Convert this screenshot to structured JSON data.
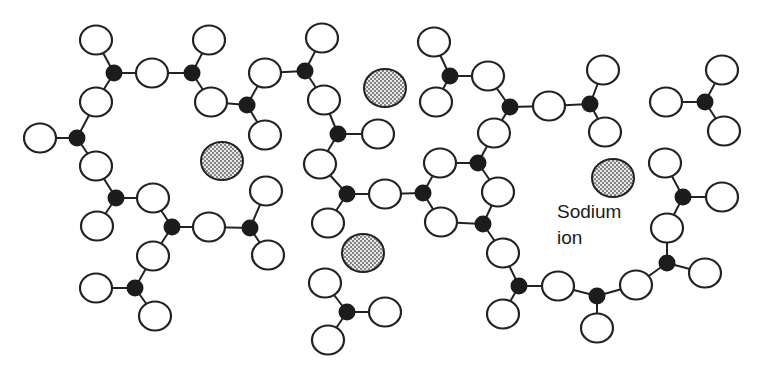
{
  "diagram": {
    "label": {
      "line1": "Sodium",
      "line2": "ion"
    },
    "legend_colors": {
      "oxygen_fill": "#ffffff",
      "silicon_fill": "#1c1c1c",
      "sodium_pattern": "stippled grey"
    },
    "silicon": [
      [
        114,
        73
      ],
      [
        192,
        73
      ],
      [
        247,
        105
      ],
      [
        77,
        138
      ],
      [
        116,
        198
      ],
      [
        172,
        227
      ],
      [
        250,
        228
      ],
      [
        135,
        288
      ],
      [
        305,
        71
      ],
      [
        338,
        134
      ],
      [
        347,
        194
      ],
      [
        423,
        193
      ],
      [
        347,
        312
      ],
      [
        450,
        76
      ],
      [
        510,
        107
      ],
      [
        590,
        104
      ],
      [
        478,
        163
      ],
      [
        483,
        224
      ],
      [
        519,
        286
      ],
      [
        597,
        296
      ],
      [
        705,
        102
      ],
      [
        683,
        197
      ],
      [
        667,
        263
      ]
    ],
    "oxygen": [
      [
        96,
        40
      ],
      [
        96,
        102
      ],
      [
        152,
        73
      ],
      [
        209,
        40
      ],
      [
        211,
        102
      ],
      [
        40,
        138
      ],
      [
        96,
        166
      ],
      [
        97,
        226
      ],
      [
        153,
        198
      ],
      [
        209,
        227
      ],
      [
        266,
        191
      ],
      [
        268,
        255
      ],
      [
        153,
        256
      ],
      [
        96,
        288
      ],
      [
        155,
        316
      ],
      [
        265,
        73
      ],
      [
        265,
        135
      ],
      [
        322,
        38
      ],
      [
        324,
        100
      ],
      [
        378,
        134
      ],
      [
        320,
        164
      ],
      [
        385,
        194
      ],
      [
        328,
        223
      ],
      [
        441,
        222
      ],
      [
        325,
        283
      ],
      [
        385,
        312
      ],
      [
        328,
        340
      ],
      [
        434,
        42
      ],
      [
        436,
        102
      ],
      [
        488,
        76
      ],
      [
        549,
        106
      ],
      [
        603,
        70
      ],
      [
        605,
        132
      ],
      [
        494,
        133
      ],
      [
        440,
        163
      ],
      [
        498,
        192
      ],
      [
        503,
        253
      ],
      [
        558,
        286
      ],
      [
        503,
        314
      ],
      [
        597,
        328
      ],
      [
        636,
        285
      ],
      [
        667,
        228
      ],
      [
        665,
        163
      ],
      [
        722,
        197
      ],
      [
        705,
        273
      ],
      [
        666,
        102
      ],
      [
        722,
        70
      ],
      [
        724,
        131
      ]
    ],
    "bonds": [
      [
        [
          96,
          40
        ],
        [
          114,
          73
        ]
      ],
      [
        [
          114,
          73
        ],
        [
          96,
          102
        ]
      ],
      [
        [
          114,
          73
        ],
        [
          152,
          73
        ]
      ],
      [
        [
          152,
          73
        ],
        [
          192,
          73
        ]
      ],
      [
        [
          192,
          73
        ],
        [
          209,
          40
        ]
      ],
      [
        [
          192,
          73
        ],
        [
          211,
          102
        ]
      ],
      [
        [
          211,
          102
        ],
        [
          247,
          105
        ]
      ],
      [
        [
          247,
          105
        ],
        [
          265,
          73
        ]
      ],
      [
        [
          247,
          105
        ],
        [
          265,
          135
        ]
      ],
      [
        [
          265,
          73
        ],
        [
          305,
          71
        ]
      ],
      [
        [
          305,
          71
        ],
        [
          322,
          38
        ]
      ],
      [
        [
          305,
          71
        ],
        [
          324,
          100
        ]
      ],
      [
        [
          324,
          100
        ],
        [
          338,
          134
        ]
      ],
      [
        [
          338,
          134
        ],
        [
          378,
          134
        ]
      ],
      [
        [
          338,
          134
        ],
        [
          320,
          164
        ]
      ],
      [
        [
          320,
          164
        ],
        [
          347,
          194
        ]
      ],
      [
        [
          347,
          194
        ],
        [
          385,
          194
        ]
      ],
      [
        [
          347,
          194
        ],
        [
          328,
          223
        ]
      ],
      [
        [
          385,
          194
        ],
        [
          423,
          193
        ]
      ],
      [
        [
          423,
          193
        ],
        [
          441,
          222
        ]
      ],
      [
        [
          423,
          193
        ],
        [
          440,
          163
        ]
      ],
      [
        [
          440,
          163
        ],
        [
          478,
          163
        ]
      ],
      [
        [
          478,
          163
        ],
        [
          494,
          133
        ]
      ],
      [
        [
          478,
          163
        ],
        [
          498,
          192
        ]
      ],
      [
        [
          494,
          133
        ],
        [
          510,
          107
        ]
      ],
      [
        [
          510,
          107
        ],
        [
          488,
          76
        ]
      ],
      [
        [
          510,
          107
        ],
        [
          549,
          106
        ]
      ],
      [
        [
          549,
          106
        ],
        [
          590,
          104
        ]
      ],
      [
        [
          590,
          104
        ],
        [
          603,
          70
        ]
      ],
      [
        [
          590,
          104
        ],
        [
          605,
          132
        ]
      ],
      [
        [
          488,
          76
        ],
        [
          450,
          76
        ]
      ],
      [
        [
          450,
          76
        ],
        [
          434,
          42
        ]
      ],
      [
        [
          450,
          76
        ],
        [
          436,
          102
        ]
      ],
      [
        [
          498,
          192
        ],
        [
          483,
          224
        ]
      ],
      [
        [
          441,
          222
        ],
        [
          483,
          224
        ]
      ],
      [
        [
          483,
          224
        ],
        [
          503,
          253
        ]
      ],
      [
        [
          503,
          253
        ],
        [
          519,
          286
        ]
      ],
      [
        [
          519,
          286
        ],
        [
          558,
          286
        ]
      ],
      [
        [
          519,
          286
        ],
        [
          503,
          314
        ]
      ],
      [
        [
          558,
          286
        ],
        [
          597,
          296
        ]
      ],
      [
        [
          597,
          296
        ],
        [
          597,
          328
        ]
      ],
      [
        [
          597,
          296
        ],
        [
          636,
          285
        ]
      ],
      [
        [
          636,
          285
        ],
        [
          667,
          263
        ]
      ],
      [
        [
          667,
          263
        ],
        [
          705,
          273
        ]
      ],
      [
        [
          667,
          263
        ],
        [
          667,
          228
        ]
      ],
      [
        [
          667,
          228
        ],
        [
          683,
          197
        ]
      ],
      [
        [
          683,
          197
        ],
        [
          665,
          163
        ]
      ],
      [
        [
          683,
          197
        ],
        [
          722,
          197
        ]
      ],
      [
        [
          666,
          102
        ],
        [
          705,
          102
        ]
      ],
      [
        [
          705,
          102
        ],
        [
          722,
          70
        ]
      ],
      [
        [
          705,
          102
        ],
        [
          724,
          131
        ]
      ],
      [
        [
          40,
          138
        ],
        [
          77,
          138
        ]
      ],
      [
        [
          77,
          138
        ],
        [
          96,
          102
        ]
      ],
      [
        [
          77,
          138
        ],
        [
          96,
          166
        ]
      ],
      [
        [
          96,
          166
        ],
        [
          116,
          198
        ]
      ],
      [
        [
          116,
          198
        ],
        [
          153,
          198
        ]
      ],
      [
        [
          116,
          198
        ],
        [
          97,
          226
        ]
      ],
      [
        [
          153,
          198
        ],
        [
          172,
          227
        ]
      ],
      [
        [
          172,
          227
        ],
        [
          209,
          227
        ]
      ],
      [
        [
          172,
          227
        ],
        [
          153,
          256
        ]
      ],
      [
        [
          209,
          227
        ],
        [
          250,
          228
        ]
      ],
      [
        [
          250,
          228
        ],
        [
          266,
          191
        ]
      ],
      [
        [
          250,
          228
        ],
        [
          268,
          255
        ]
      ],
      [
        [
          153,
          256
        ],
        [
          135,
          288
        ]
      ],
      [
        [
          135,
          288
        ],
        [
          96,
          288
        ]
      ],
      [
        [
          135,
          288
        ],
        [
          155,
          316
        ]
      ],
      [
        [
          325,
          283
        ],
        [
          347,
          312
        ]
      ],
      [
        [
          347,
          312
        ],
        [
          385,
          312
        ]
      ],
      [
        [
          347,
          312
        ],
        [
          328,
          340
        ]
      ]
    ],
    "sodium_ions": [
      [
        222,
        161
      ],
      [
        385,
        88
      ],
      [
        363,
        253
      ],
      [
        613,
        178
      ]
    ]
  }
}
